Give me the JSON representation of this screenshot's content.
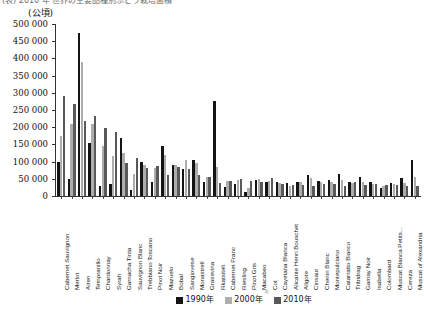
{
  "page": {
    "top_cut_text": "(表) 2010 年 世界の主要品種別ぶどう栽培面積",
    "unit_label": "(公頃)"
  },
  "legend": {
    "position": "bottom-center",
    "items": [
      {
        "label": "1990年",
        "color": "#141414"
      },
      {
        "label": "2000年",
        "color": "#adadad"
      },
      {
        "label": "2010年",
        "color": "#595959"
      }
    ]
  },
  "axis": {
    "y_ticks": [
      "0",
      "50 000",
      "100 000",
      "150 000",
      "200 000",
      "250 000",
      "300 000",
      "350 000",
      "400 000",
      "450 000",
      "500 000"
    ],
    "y_min": 0,
    "y_max": 500000,
    "y_step": 50000
  },
  "chart_data": {
    "type": "bar",
    "title": "",
    "xlabel": "",
    "ylabel": "(公頃)",
    "ylim": [
      0,
      500000
    ],
    "ytick_step": 50000,
    "grid": false,
    "legend_position": "bottom-center",
    "categories": [
      "Cabernet Sauvignon",
      "Merlot",
      "Airen",
      "Tempranillo",
      "Chardonnay",
      "Syrah",
      "Garnacha Tinta",
      "Sauvignon Blanc",
      "Trebbiano Toscano",
      "Pinot Noir",
      "Mazuelo",
      "Bobal",
      "Sangiovese",
      "Monastrell",
      "Grasevina",
      "Rkatsiteli",
      "Cabernet Franc",
      "Riesling",
      "Pinot Gris",
      "Macabeo",
      "Cot",
      "Cayetana Blanca",
      "Alicante Henri Bouschet",
      "Aligote",
      "Cinsaut",
      "Chenin Blanc",
      "Montepulciano",
      "Catarratto Bianco",
      "Tribidrag",
      "Gamay Noir",
      "Isabella",
      "Colombard",
      "Muscat Blanca Petits...",
      "Cereza",
      "Muscat of Alexandria"
    ],
    "series": [
      {
        "name": "1990年",
        "color": "#141414",
        "values": [
          100000,
          50000,
          475000,
          155000,
          30000,
          35000,
          170000,
          18000,
          100000,
          42000,
          145000,
          90000,
          78000,
          105000,
          42000,
          275000,
          27000,
          35000,
          12000,
          48000,
          40000,
          42000,
          38000,
          42000,
          62000,
          45000,
          48000,
          65000,
          42000,
          55000,
          40000,
          22000,
          38000,
          52000,
          105000
        ],
        "units": "ha"
      },
      {
        "name": "2000年",
        "color": "#adadad",
        "values": [
          175000,
          210000,
          390000,
          210000,
          145000,
          115000,
          125000,
          65000,
          90000,
          80000,
          120000,
          90000,
          105000,
          95000,
          55000,
          85000,
          45000,
          47000,
          22000,
          50000,
          45000,
          38000,
          30000,
          40000,
          52000,
          42000,
          42000,
          48000,
          38000,
          40000,
          35000,
          30000,
          35000,
          38000,
          55000
        ],
        "units": "ha"
      },
      {
        "name": "2010年",
        "color": "#595959",
        "values": [
          290000,
          267000,
          218000,
          232000,
          198000,
          185000,
          95000,
          110000,
          80000,
          86000,
          60000,
          83000,
          78000,
          62000,
          55000,
          38000,
          45000,
          50000,
          44000,
          40000,
          52000,
          36000,
          32000,
          32000,
          30000,
          36000,
          35000,
          30000,
          40000,
          33000,
          35000,
          32000,
          32000,
          30000,
          28000
        ],
        "units": "ha"
      }
    ]
  }
}
